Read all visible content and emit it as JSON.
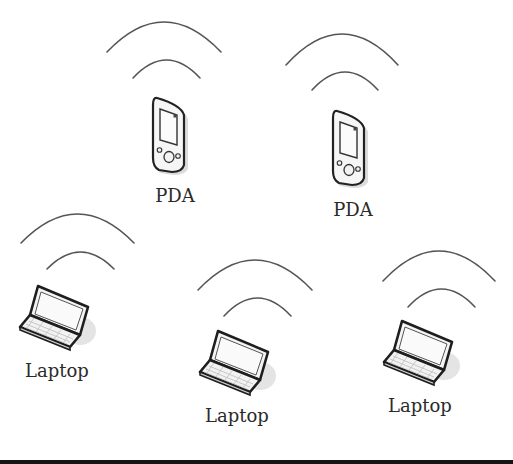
{
  "diagram": {
    "type": "wireless ad hoc network",
    "colors": {
      "background": "#ffffff",
      "stroke": "#555555",
      "device_outline": "#222222",
      "device_fill": "#f4f4f4",
      "shadow": "#d9d9d9",
      "label": "#2a2a2a",
      "bottom_rule": "#141414"
    },
    "nodes": [
      {
        "id": "pda-1",
        "kind": "PDA",
        "label": "PDA",
        "icon": "pda-icon",
        "x": 151,
        "y": 95,
        "label_x": 175,
        "label_y": 187,
        "signal": {
          "outer": [
            107,
            22,
            221,
            52
          ],
          "inner": [
            133,
            60,
            200,
            78
          ]
        }
      },
      {
        "id": "pda-2",
        "kind": "PDA",
        "label": "PDA",
        "icon": "pda-icon",
        "x": 331,
        "y": 108,
        "label_x": 353,
        "label_y": 201,
        "signal": {
          "outer": [
            286,
            34,
            398,
            65
          ],
          "inner": [
            312,
            72,
            378,
            90
          ]
        }
      },
      {
        "id": "laptop-1",
        "kind": "Laptop",
        "label": "Laptop",
        "icon": "laptop-icon",
        "x": 18,
        "y": 283,
        "label_x": 57,
        "label_y": 362,
        "signal": {
          "outer": [
            21,
            214,
            134,
            243
          ],
          "inner": [
            47,
            252,
            114,
            269
          ]
        }
      },
      {
        "id": "laptop-2",
        "kind": "Laptop",
        "label": "Laptop",
        "icon": "laptop-icon",
        "x": 198,
        "y": 328,
        "label_x": 237,
        "label_y": 407,
        "signal": {
          "outer": [
            198,
            260,
            312,
            290
          ],
          "inner": [
            224,
            298,
            291,
            316
          ]
        }
      },
      {
        "id": "laptop-3",
        "kind": "Laptop",
        "label": "Laptop",
        "icon": "laptop-icon",
        "x": 382,
        "y": 318,
        "label_x": 420,
        "label_y": 397,
        "signal": {
          "outer": [
            383,
            251,
            495,
            281
          ],
          "inner": [
            408,
            289,
            475,
            307
          ]
        }
      }
    ]
  }
}
